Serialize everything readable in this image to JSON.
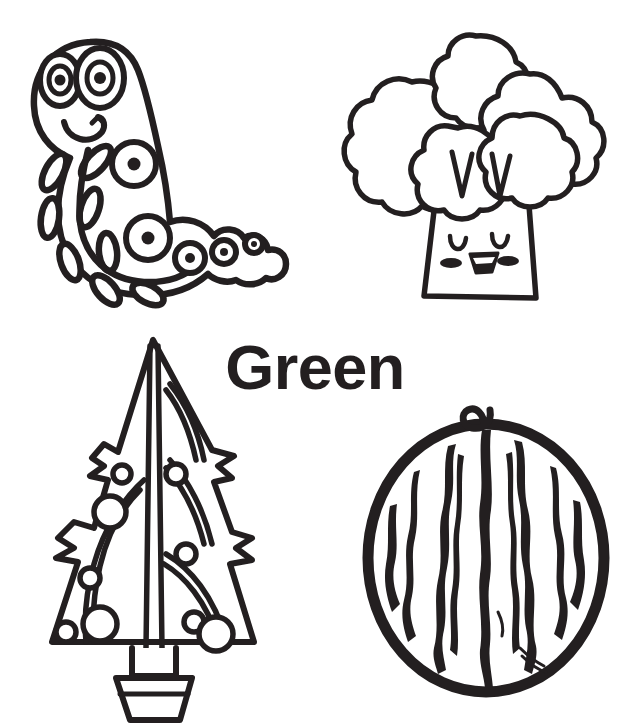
{
  "page": {
    "kind": "coloring-page",
    "title_word": "Green",
    "background_color": "#ffffff",
    "ink_color": "#231f20",
    "width": 627,
    "height": 728
  },
  "illustrations": [
    {
      "id": "caterpillar",
      "name": "caterpillar",
      "alt": "Smiling cartoon caterpillar with two big eyes, spotted body and legs",
      "position": "top-left"
    },
    {
      "id": "broccoli",
      "name": "broccoli",
      "alt": "Happy cartoon broccoli with closed eyes, blush cheeks and open smile",
      "position": "top-right"
    },
    {
      "id": "tree",
      "name": "christmas-tree",
      "alt": "Decorated triangular Christmas tree with ornaments in a pot",
      "position": "bottom-left"
    },
    {
      "id": "watermelon",
      "name": "watermelon",
      "alt": "Whole striped watermelon with a curly stem",
      "position": "bottom-right"
    }
  ],
  "label": {
    "text": "Green",
    "color": "#231f20"
  }
}
